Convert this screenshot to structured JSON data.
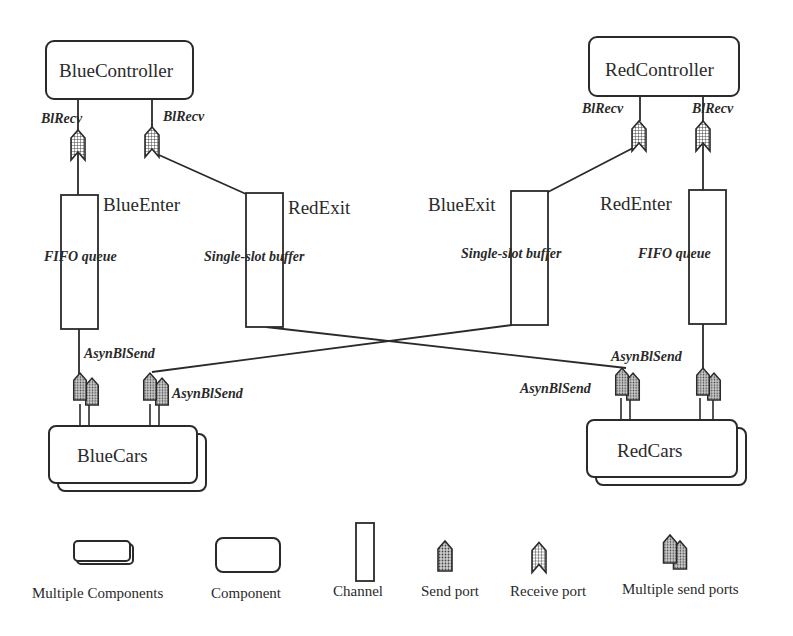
{
  "components": {
    "blue_controller": "BlueController",
    "red_controller": "RedController",
    "blue_cars": "BlueCars",
    "red_cars": "RedCars"
  },
  "channels": {
    "blue_enter": {
      "name": "BlueEnter",
      "type": "FIFO queue"
    },
    "red_exit": {
      "name": "RedExit",
      "type": "Single-slot buffer"
    },
    "blue_exit": {
      "name": "BlueExit",
      "type": "Single-slot buffer"
    },
    "red_enter": {
      "name": "RedEnter",
      "type": "FIFO queue"
    }
  },
  "ports": {
    "blue_ctrl_recv_1": "BlRecv",
    "blue_ctrl_recv_2": "BlRecv",
    "red_ctrl_recv_1": "BlRecv",
    "red_ctrl_recv_2": "BlRecv",
    "blue_cars_send_1": "AsynBlSend",
    "blue_cars_send_2": "AsynBlSend",
    "red_cars_send_1": "AsynBlSend",
    "red_cars_send_2": "AsynBlSend"
  },
  "legend": {
    "multiple_components": "Multiple Components",
    "component": "Component",
    "channel": "Channel",
    "send_port": "Send port",
    "receive_port": "Receive port",
    "multiple_send_ports": "Multiple send ports"
  }
}
